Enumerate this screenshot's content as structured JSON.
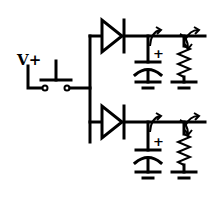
{
  "diagram": {
    "type": "circuit-schematic",
    "supply_label": "V+",
    "capacitor_polarity_mark": "+",
    "components": [
      {
        "id": "supply",
        "kind": "voltage-source-terminal",
        "label": "V+"
      },
      {
        "id": "switch",
        "kind": "push-button-switch"
      },
      {
        "id": "diode-top",
        "kind": "diode"
      },
      {
        "id": "diode-bottom",
        "kind": "diode"
      },
      {
        "id": "cap-top",
        "kind": "polarized-capacitor",
        "mark": "+"
      },
      {
        "id": "cap-bottom",
        "kind": "polarized-capacitor",
        "mark": "+"
      },
      {
        "id": "res-top",
        "kind": "resistor"
      },
      {
        "id": "res-bottom",
        "kind": "resistor"
      }
    ],
    "colors": {
      "stroke": "#000000",
      "background": "#ffffff"
    }
  }
}
